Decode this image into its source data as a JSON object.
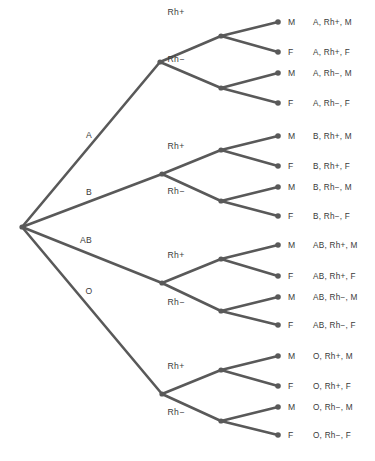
{
  "diagram": {
    "type": "probability-tree",
    "title": "",
    "root": {
      "x": 22,
      "y": 227
    },
    "colors": {
      "edge": "#595959",
      "node": "#595959",
      "text": "#3b3b3b",
      "background": "#ffffff"
    },
    "level1_label_name": "Blood type",
    "level2_label_name": "Rh factor",
    "level3_label_name": "Sex",
    "branches": [
      {
        "label": "A",
        "label_pos": {
          "x": 89,
          "y": 138
        },
        "node": {
          "x": 160,
          "y": 62
        },
        "sub": [
          {
            "label": "Rh+",
            "label_pos": {
              "x": 176,
              "y": 15
            },
            "node": {
              "x": 221,
              "y": 36
            },
            "leaves": [
              {
                "label": "M",
                "outcome": "A, Rh+, M",
                "dot": {
                  "x": 278,
                  "y": 22
                }
              },
              {
                "label": "F",
                "outcome": "A, Rh+, F",
                "dot": {
                  "x": 278,
                  "y": 52
                }
              }
            ]
          },
          {
            "label": "Rh−",
            "label_pos": {
              "x": 176,
              "y": 62
            },
            "node": {
              "x": 221,
              "y": 88
            },
            "leaves": [
              {
                "label": "M",
                "outcome": "A, Rh−, M",
                "dot": {
                  "x": 278,
                  "y": 73
                }
              },
              {
                "label": "F",
                "outcome": "A, Rh−, F",
                "dot": {
                  "x": 278,
                  "y": 103
                }
              }
            ]
          }
        ]
      },
      {
        "label": "B",
        "label_pos": {
          "x": 89,
          "y": 195
        },
        "node": {
          "x": 162,
          "y": 174
        },
        "sub": [
          {
            "label": "Rh+",
            "label_pos": {
              "x": 176,
              "y": 149
            },
            "node": {
              "x": 221,
              "y": 150
            },
            "leaves": [
              {
                "label": "M",
                "outcome": "B, Rh+, M",
                "dot": {
                  "x": 278,
                  "y": 136
                }
              },
              {
                "label": "F",
                "outcome": "B, Rh+, F",
                "dot": {
                  "x": 278,
                  "y": 166
                }
              }
            ]
          },
          {
            "label": "Rh−",
            "label_pos": {
              "x": 176,
              "y": 194
            },
            "node": {
              "x": 221,
              "y": 201
            },
            "leaves": [
              {
                "label": "M",
                "outcome": "B, Rh−, M",
                "dot": {
                  "x": 278,
                  "y": 187
                }
              },
              {
                "label": "F",
                "outcome": "B, Rh−, F",
                "dot": {
                  "x": 278,
                  "y": 216
                }
              }
            ]
          }
        ]
      },
      {
        "label": "AB",
        "label_pos": {
          "x": 86,
          "y": 243
        },
        "node": {
          "x": 162,
          "y": 283
        },
        "sub": [
          {
            "label": "Rh+",
            "label_pos": {
              "x": 176,
              "y": 258
            },
            "node": {
              "x": 221,
              "y": 259
            },
            "leaves": [
              {
                "label": "M",
                "outcome": "AB, Rh+, M",
                "dot": {
                  "x": 278,
                  "y": 245
                }
              },
              {
                "label": "F",
                "outcome": "AB, Rh+, F",
                "dot": {
                  "x": 278,
                  "y": 276
                }
              }
            ]
          },
          {
            "label": "Rh−",
            "label_pos": {
              "x": 176,
              "y": 305
            },
            "node": {
              "x": 221,
              "y": 311
            },
            "leaves": [
              {
                "label": "M",
                "outcome": "AB, Rh−, M",
                "dot": {
                  "x": 278,
                  "y": 297
                }
              },
              {
                "label": "F",
                "outcome": "AB, Rh−, F",
                "dot": {
                  "x": 278,
                  "y": 325
                }
              }
            ]
          }
        ]
      },
      {
        "label": "O",
        "label_pos": {
          "x": 89,
          "y": 294
        },
        "node": {
          "x": 162,
          "y": 394
        },
        "sub": [
          {
            "label": "Rh+",
            "label_pos": {
              "x": 176,
              "y": 369
            },
            "node": {
              "x": 221,
              "y": 370
            },
            "leaves": [
              {
                "label": "M",
                "outcome": "O, Rh+, M",
                "dot": {
                  "x": 278,
                  "y": 356
                }
              },
              {
                "label": "F",
                "outcome": "O, Rh+, F",
                "dot": {
                  "x": 278,
                  "y": 386
                }
              }
            ]
          },
          {
            "label": "Rh−",
            "label_pos": {
              "x": 176,
              "y": 415
            },
            "node": {
              "x": 221,
              "y": 421
            },
            "leaves": [
              {
                "label": "M",
                "outcome": "O, Rh−, M",
                "dot": {
                  "x": 278,
                  "y": 407
                }
              },
              {
                "label": "F",
                "outcome": "O, Rh−, F",
                "dot": {
                  "x": 278,
                  "y": 435
                }
              }
            ]
          }
        ]
      }
    ],
    "leaf_label_x": 288,
    "outcome_x": 313
  }
}
